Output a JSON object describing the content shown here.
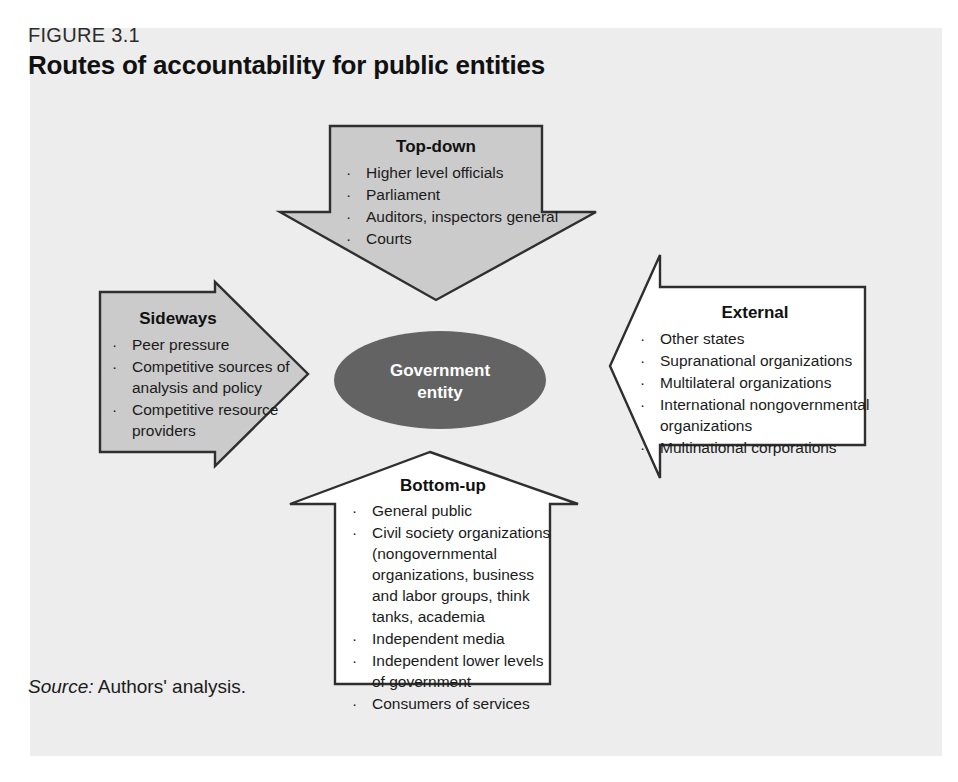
{
  "figure": {
    "number": "FIGURE 3.1",
    "title": "Routes of accountability for public entities",
    "source": {
      "label": "Source:",
      "text": " Authors' analysis."
    }
  },
  "colors": {
    "panel_background": "#ededed",
    "arrow_gray_fill": "#cbcbcb",
    "arrow_white_fill": "#ffffff",
    "arrow_outline": "#2f2f2f",
    "center_fill": "#636363",
    "center_text": "#ffffff"
  },
  "center": {
    "label_line1": "Government",
    "label_line2": "entity"
  },
  "blocks": {
    "top_down": {
      "title": "Top-down",
      "direction": "down",
      "fill": "gray",
      "items": [
        "Higher level officials",
        "Parliament",
        "Auditors, inspectors general",
        "Courts"
      ]
    },
    "sideways": {
      "title": "Sideways",
      "direction": "right",
      "fill": "gray",
      "items": [
        "Peer pressure",
        "Competitive sources of",
        "analysis and policy",
        "Competitive resource",
        "providers"
      ],
      "bulleted": [
        true,
        true,
        false,
        true,
        false
      ]
    },
    "external": {
      "title": "External",
      "direction": "left",
      "fill": "white",
      "items": [
        "Other states",
        "Supranational organizations",
        "Multilateral organizations",
        "International nongovernmental",
        "organizations",
        "Multinational corporations"
      ],
      "bulleted": [
        true,
        true,
        true,
        true,
        false,
        true
      ]
    },
    "bottom_up": {
      "title": "Bottom-up",
      "direction": "up",
      "fill": "white",
      "items": [
        "General public",
        "Civil society organizations",
        "(nongovernmental",
        "organizations, business",
        "and labor groups, think",
        "tanks, academia",
        "Independent media",
        "Independent lower levels",
        "of government",
        "Consumers of services"
      ],
      "bulleted": [
        true,
        true,
        false,
        false,
        false,
        false,
        true,
        true,
        false,
        true
      ]
    }
  }
}
